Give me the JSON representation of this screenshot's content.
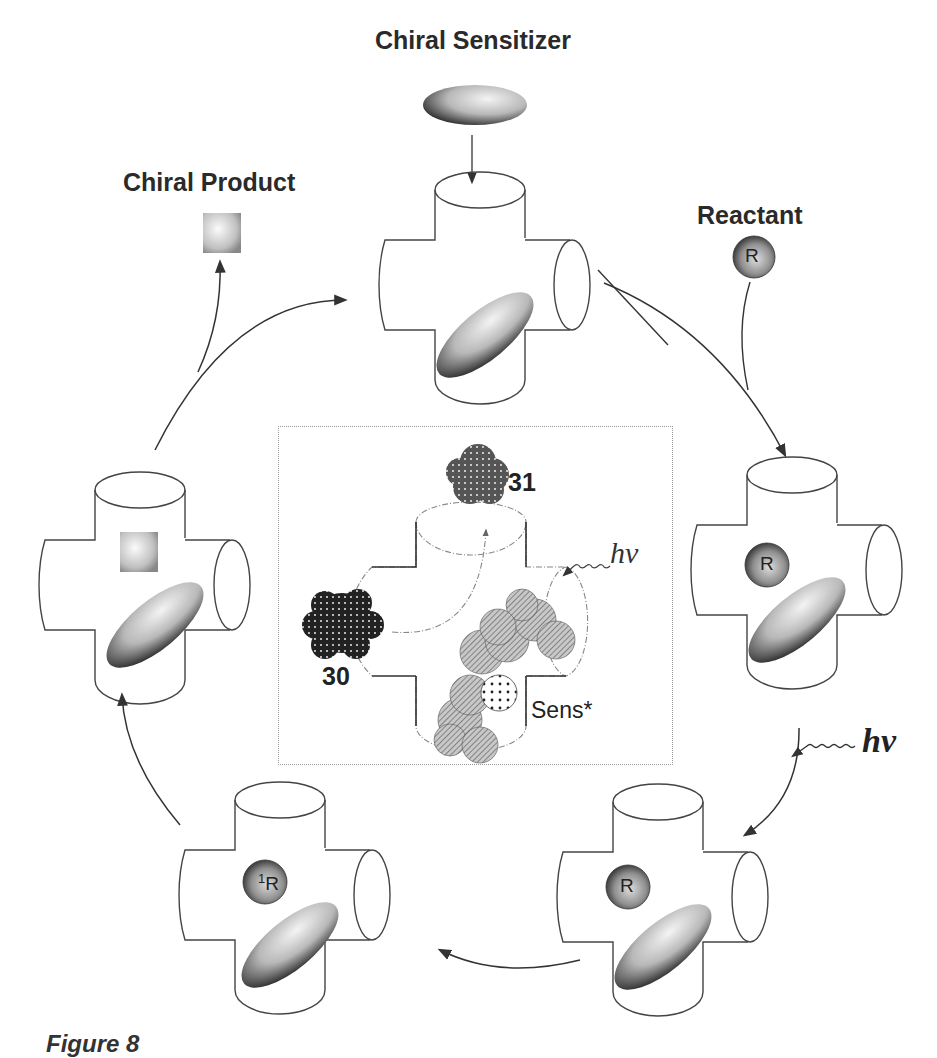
{
  "labels": {
    "chiral_sensitizer": "Chiral Sensitizer",
    "chiral_product": "Chiral Product",
    "reactant": "Reactant",
    "hv_outer": "hν",
    "hv_inset": "hν",
    "compound_30": "30",
    "compound_31": "31",
    "sens_star": "Sens*",
    "reactant_symbol": "R",
    "singlet_reactant_symbol": "R",
    "singlet_superscript": "1",
    "caption": "Figure 8"
  },
  "cycle_stages": [
    {
      "position": "top",
      "contents": "host + chiral sensitizer"
    },
    {
      "position": "right-upper",
      "contents": "host + sensitizer + R"
    },
    {
      "position": "right-lower",
      "contents": "host + sensitizer + R (excited by hν)"
    },
    {
      "position": "bottom-left",
      "contents": "host + sensitizer + 1R"
    },
    {
      "position": "left",
      "contents": "host + sensitizer + chiral product"
    }
  ],
  "colors": {
    "line": "#333333",
    "shape_fill_dark": "#3a3a3a",
    "shape_fill_light": "#e8e8e8",
    "inset_border": "#999999"
  }
}
